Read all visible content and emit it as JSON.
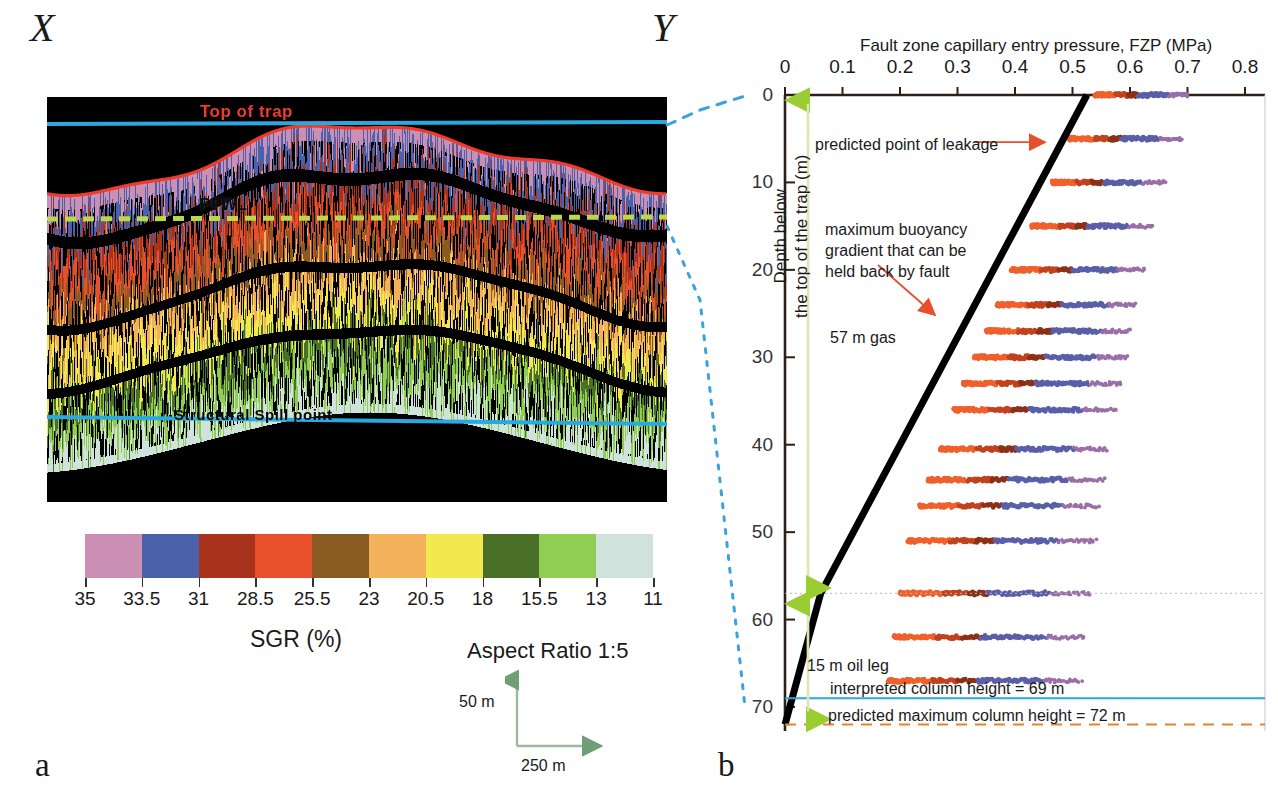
{
  "figure": {
    "panel_a_letter": "a",
    "panel_b_letter": "b",
    "section_start_label": "X",
    "section_end_label": "Y"
  },
  "panel_a": {
    "labels": {
      "top_of_trap": "Top of trap",
      "pfwl": "PFWL",
      "structural_spill_point": "Structural Spill point"
    },
    "legend": {
      "caption": "SGR (%)",
      "tick_labels": [
        "35",
        "33.5",
        "31",
        "28.5",
        "25.5",
        "23",
        "20.5",
        "18",
        "15.5",
        "13",
        "11"
      ],
      "colors": [
        "#cb8fb4",
        "#4a62ab",
        "#a8331a",
        "#e8502c",
        "#8a5a23",
        "#f3b25a",
        "#f2e84f",
        "#4a7028",
        "#8fce52",
        "#cfe2dc"
      ]
    },
    "scale": {
      "aspect_ratio": "Aspect Ratio 1:5",
      "vertical": "50 m",
      "horizontal": "250 m"
    },
    "colors": {
      "top_of_trap_line": "#ef3b2c",
      "horizontal_datum_line": "#2aa9e0",
      "pfwl_line": "#b9d94a"
    }
  },
  "panel_b": {
    "title": "Fault zone capillary entry pressure, FZP (MPa)",
    "ylabel": "Depth below\nthe top of the trap (m)",
    "annotations": {
      "predicted_point_of_leakage": "predicted point of leakage",
      "maximum_buoyancy": "maximum buoyancy\ngradient that can be\nheld back by fault",
      "gas_column": "57 m gas",
      "oil_leg": "15 m oil leg",
      "interpreted_column_height": "interpreted column height = 69 m",
      "predicted_maximum_column_height": "predicted maximum column height = 72 m"
    },
    "colors": {
      "buoyancy_line": "#000000",
      "arrow": "#e8502c",
      "green_arrow": "#9acd32",
      "interpreted_line": "#2aa9e0",
      "predicted_line": "#e8802c",
      "connector": "#3aa3dd"
    }
  },
  "chart_data": {
    "type": "scatter",
    "title": "Fault zone capillary entry pressure, FZP (MPa)",
    "xlabel": "Fault zone capillary entry pressure, FZP (MPa)",
    "ylabel": "Depth below the top of the trap (m)",
    "xlim": [
      0,
      0.8
    ],
    "ylim": [
      72,
      0
    ],
    "xticks": [
      0,
      0.1,
      0.2,
      0.3,
      0.4,
      0.5,
      0.6,
      0.7,
      0.8
    ],
    "yticks": [
      0,
      10,
      20,
      30,
      40,
      50,
      60,
      70
    ],
    "grid": false,
    "legend": "none",
    "series": [
      {
        "name": "maximum buoyancy gradient held back by fault",
        "type": "line",
        "comment": "two-segment line: steep gas gradient above 57 m, shallower oil gradient below",
        "points": [
          [
            0.525,
            0
          ],
          [
            0.062,
            57
          ],
          [
            0.0,
            72
          ]
        ]
      },
      {
        "name": "interpreted column height",
        "type": "hline",
        "y": 69,
        "value_label": "interpreted column height = 69 m"
      },
      {
        "name": "predicted maximum column height",
        "type": "hline-dashed",
        "y": 72,
        "value_label": "predicted maximum column height = 72 m"
      },
      {
        "name": "gas column extent",
        "type": "vspan-arrow",
        "x": 0.04,
        "y_from": 0,
        "y_to": 57,
        "value_label": "57 m gas"
      },
      {
        "name": "oil leg extent",
        "type": "vspan-arrow",
        "x": 0.04,
        "y_from": 57,
        "y_to": 72,
        "value_label": "15 m oil leg"
      },
      {
        "name": "fault zone capillary entry pressure samples",
        "type": "scatter-rows",
        "comment": "each row is a swarm of FZP samples at one sampled depth; x_min/x_max give the swarm span in MPa, colours follow the SGR legend (orange=low SGR .. pink=high SGR)",
        "rows": [
          {
            "depth": 0,
            "x_min": 0.54,
            "x_max": 0.7
          },
          {
            "depth": 5,
            "x_min": 0.495,
            "x_max": 0.69
          },
          {
            "depth": 10,
            "x_min": 0.465,
            "x_max": 0.66
          },
          {
            "depth": 15,
            "x_min": 0.43,
            "x_max": 0.64
          },
          {
            "depth": 20,
            "x_min": 0.395,
            "x_max": 0.625
          },
          {
            "depth": 24,
            "x_min": 0.37,
            "x_max": 0.61
          },
          {
            "depth": 27,
            "x_min": 0.35,
            "x_max": 0.6
          },
          {
            "depth": 30,
            "x_min": 0.33,
            "x_max": 0.595
          },
          {
            "depth": 33,
            "x_min": 0.31,
            "x_max": 0.585
          },
          {
            "depth": 36,
            "x_min": 0.295,
            "x_max": 0.575
          },
          {
            "depth": 40.5,
            "x_min": 0.27,
            "x_max": 0.56
          },
          {
            "depth": 44,
            "x_min": 0.25,
            "x_max": 0.555
          },
          {
            "depth": 47,
            "x_min": 0.235,
            "x_max": 0.545
          },
          {
            "depth": 51,
            "x_min": 0.215,
            "x_max": 0.54
          },
          {
            "depth": 57,
            "x_min": 0.2,
            "x_max": 0.53
          },
          {
            "depth": 62,
            "x_min": 0.19,
            "x_max": 0.52
          },
          {
            "depth": 67,
            "x_min": 0.18,
            "x_max": 0.515
          }
        ]
      }
    ]
  }
}
